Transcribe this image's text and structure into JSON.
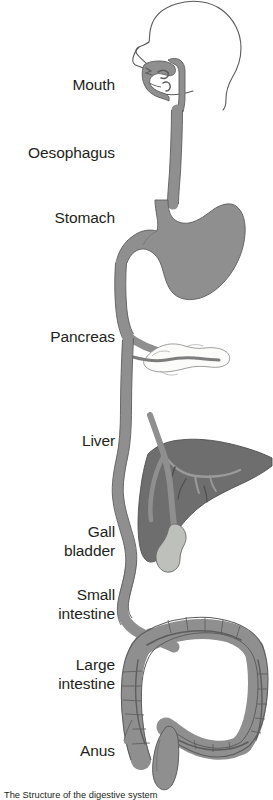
{
  "figure": {
    "background_color": "#ffffff",
    "width": 273,
    "height": 800
  },
  "colors": {
    "tract_fill": "#8f8f8f",
    "tract_stroke": "#5d5d5d",
    "stomach_fill": "#8f8f8f",
    "liver_fill": "#6e6e6e",
    "liver_stroke": "#4f4f4f",
    "gallbladder_fill": "#bdc0bb",
    "gallbladder_stroke": "#6e6e6e",
    "pancreas_fill": "#fbfbfa",
    "pancreas_stroke": "#8d8d8d",
    "head_outline": "#5a5a5a",
    "label_text": "#231f20"
  },
  "labels": [
    {
      "id": "mouth",
      "text": "Mouth",
      "lines": [
        "Mouth"
      ],
      "top": 75
    },
    {
      "id": "oesophagus",
      "text": "Oesophagus",
      "lines": [
        "Oesophagus"
      ],
      "top": 143
    },
    {
      "id": "stomach",
      "text": "Stomach",
      "lines": [
        "Stomach"
      ],
      "top": 208
    },
    {
      "id": "pancreas",
      "text": "Pancreas",
      "lines": [
        "Pancreas"
      ],
      "top": 327
    },
    {
      "id": "liver",
      "text": "Liver",
      "lines": [
        "Liver"
      ],
      "top": 431
    },
    {
      "id": "gall-bladder",
      "text": "Gall bladder",
      "lines": [
        "Gall",
        "bladder"
      ],
      "top": 522
    },
    {
      "id": "small-intestine",
      "text": "Small intestine",
      "lines": [
        "Small",
        "intestine"
      ],
      "top": 585
    },
    {
      "id": "large-intestine",
      "text": "Large intestine",
      "lines": [
        "Large",
        "intestine"
      ],
      "top": 655
    },
    {
      "id": "anus",
      "text": "Anus",
      "lines": [
        "Anus"
      ],
      "top": 741
    }
  ],
  "organs": [
    {
      "id": "head",
      "name": "head-outline"
    },
    {
      "id": "mouth-cavity",
      "name": "mouth-and-pharynx"
    },
    {
      "id": "oesophagus",
      "name": "oesophagus-tube"
    },
    {
      "id": "stomach",
      "name": "stomach"
    },
    {
      "id": "duodenum",
      "name": "duodenum"
    },
    {
      "id": "pancreas",
      "name": "pancreas"
    },
    {
      "id": "liver",
      "name": "liver"
    },
    {
      "id": "gallbladder",
      "name": "gall-bladder"
    },
    {
      "id": "bile-duct",
      "name": "bile-duct"
    },
    {
      "id": "small-intestine",
      "name": "small-intestine"
    },
    {
      "id": "large-intestine",
      "name": "large-intestine"
    },
    {
      "id": "rectum",
      "name": "rectum-and-anus"
    }
  ],
  "caption": {
    "visible": true,
    "text": "The Structure of the digestive system"
  }
}
